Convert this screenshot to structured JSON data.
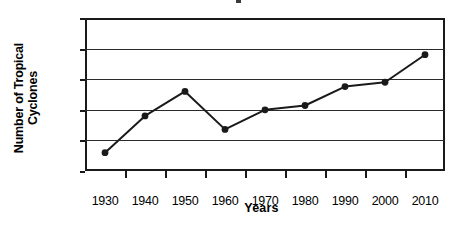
{
  "chart_data": {
    "type": "line",
    "title": "",
    "xlabel": "Years",
    "ylabel": "Number of Tropical\nCyclones",
    "categories": [
      "1930",
      "1940",
      "1950",
      "1960",
      "1970",
      "1980",
      "1990",
      "2000",
      "2010"
    ],
    "values": [
      3,
      9,
      13,
      6.8,
      10,
      10.7,
      13.8,
      14.5,
      19
    ],
    "series": [
      {
        "name": "Number of Tropical Cyclones",
        "values": [
          3,
          9,
          13,
          6.8,
          10,
          10.7,
          13.8,
          14.5,
          19
        ]
      }
    ],
    "ylim": [
      0,
      25
    ],
    "yticks": [
      0,
      5,
      10,
      15,
      20,
      25
    ],
    "ytick_labels": [
      "0",
      "5",
      "10",
      "15",
      "20",
      "25"
    ],
    "grid": "horizontal",
    "legend": "none",
    "marker": "filled-circle",
    "line_color": "#1a1a1a",
    "marker_color": "#1a1a1a",
    "background_color": "#ffffff",
    "axis_color": "#1a1a1a"
  },
  "axes": {
    "y_title_line1": "Number of Tropical",
    "y_title_line2": "Cyclones",
    "x_title": "Years"
  }
}
